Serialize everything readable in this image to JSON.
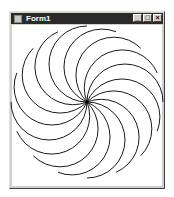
{
  "window": {
    "title": "Form1",
    "controls": {
      "minimize": "_",
      "maximize": "□",
      "close": "×"
    }
  },
  "drawing": {
    "type": "spiral-arcs",
    "center": [
      87,
      102
    ],
    "radius": 76,
    "arc_count": 16,
    "stroke": "#000000"
  }
}
